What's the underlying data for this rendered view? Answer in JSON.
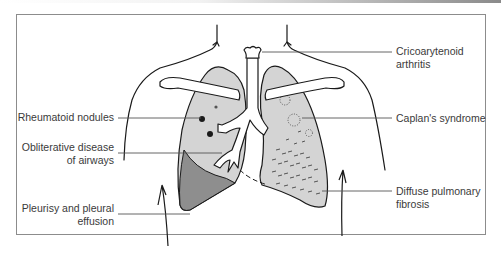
{
  "figure": {
    "type": "anatomical-diagram",
    "colors": {
      "lung_fill": "#d4d4d4",
      "effusion_fill": "#8e8e8e",
      "outline": "#1a1a1a",
      "label_text": "#3a3a3a",
      "leader_line": "#555555",
      "frame": "#8c8c8c"
    }
  },
  "labels": {
    "left": [
      {
        "id": "rheumatoid-nodules",
        "line1": "Rheumatoid nodules",
        "line2": ""
      },
      {
        "id": "obliterative-disease",
        "line1": "Obliterative disease",
        "line2": "of airways"
      },
      {
        "id": "pleurisy",
        "line1": "Pleurisy and pleural",
        "line2": "effusion"
      }
    ],
    "right": [
      {
        "id": "cricoarytenoid",
        "line1": "Cricoarytenoid",
        "line2": "arthritis"
      },
      {
        "id": "caplans",
        "line1": "Caplan's syndrome",
        "line2": ""
      },
      {
        "id": "diffuse-fibrosis",
        "line1": "Diffuse pulmonary",
        "line2": "fibrosis"
      }
    ]
  }
}
